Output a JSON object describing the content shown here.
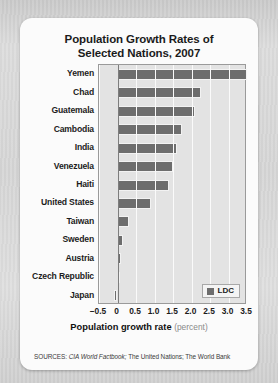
{
  "title": {
    "line1": "Population Growth Rates of",
    "line2": "Selected Nations, 2007"
  },
  "axis": {
    "x_title_bold": "Population growth rate",
    "x_title_unit": "(percent)",
    "ticks": [
      "–0.5",
      "0",
      "0.5",
      "1.0",
      "1.5",
      "2.0",
      "2.5",
      "3.0",
      "3.5"
    ]
  },
  "legend": {
    "items": [
      {
        "label": "LDC",
        "color": "#6d6d6d"
      }
    ]
  },
  "sources": {
    "prefix": "SOURCES:",
    "italic": "CIA World Factbook;",
    "rest": "The United Nations; The World Bank"
  },
  "chart_data": {
    "type": "bar",
    "orientation": "horizontal",
    "title": "Population Growth Rates of Selected Nations, 2007",
    "xlabel": "Population growth rate (percent)",
    "ylabel": "",
    "xlim": [
      -0.5,
      3.5
    ],
    "grid": true,
    "legend_position": "bottom-right",
    "bar_color": "#6d6d6d",
    "categories": [
      "Yemen",
      "Chad",
      "Guatemala",
      "Cambodia",
      "India",
      "Venezuela",
      "Haiti",
      "United States",
      "Taiwan",
      "Sweden",
      "Austria",
      "Czech Republic",
      "Japan"
    ],
    "values": [
      3.5,
      2.25,
      2.1,
      1.75,
      1.6,
      1.5,
      1.4,
      0.9,
      0.3,
      0.16,
      0.09,
      0.06,
      -0.09
    ],
    "series": [
      {
        "name": "LDC",
        "values": [
          3.5,
          2.25,
          2.1,
          1.75,
          1.6,
          1.5,
          1.4,
          0.9,
          0.3,
          0.16,
          0.09,
          0.06,
          -0.09
        ]
      }
    ]
  }
}
